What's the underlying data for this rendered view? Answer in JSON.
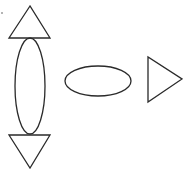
{
  "diagram": {
    "background": "#ffffff",
    "stroke_color": "#2a2a2a",
    "shapes": [
      {
        "type": "triangle-up",
        "points": "30,6 9,38 50,38"
      },
      {
        "type": "ellipse-vertical",
        "cx": 30,
        "cy": 86,
        "rx": 15,
        "ry": 48
      },
      {
        "type": "triangle-down",
        "points": "9,135 50,135 30,168"
      },
      {
        "type": "ellipse-horizontal",
        "cx": 98,
        "cy": 81,
        "rx": 33,
        "ry": 15
      },
      {
        "type": "triangle-right",
        "points": "148,57 148,102 182,79"
      }
    ]
  }
}
